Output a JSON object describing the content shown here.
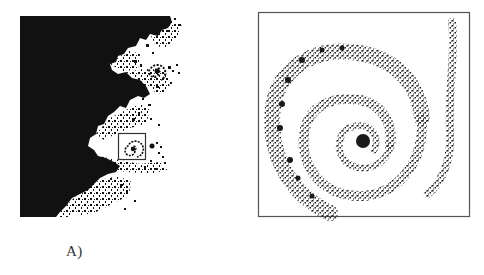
{
  "figure": {
    "panels": [
      {
        "id": "A",
        "label": "A)",
        "description": "Mandelbrot set boundary region with inset box marking zoom area",
        "colors": {
          "set": "#111111",
          "background": "#ffffff",
          "inset_box": "#333333"
        }
      },
      {
        "id": "B",
        "label": "B)",
        "description": "Magnified spiral detail of the boxed region",
        "colors": {
          "points": "#1a1a1a",
          "frame": "#555555",
          "background": "#ffffff"
        }
      }
    ]
  }
}
